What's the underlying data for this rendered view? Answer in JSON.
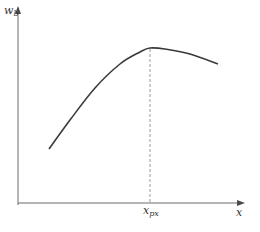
{
  "chart_data": {
    "type": "line",
    "title": "",
    "xlabel": "x",
    "ylabel": "w_b",
    "ylabel_main": "w",
    "ylabel_sub": "b",
    "xtick_label_main": "x",
    "xtick_label_sub": "px",
    "annotations": [
      {
        "type": "vertical-dashed-line",
        "at": "x_px",
        "description": "peak location"
      }
    ],
    "series": [
      {
        "name": "w_b(x)",
        "description": "concave curve rising from lower-left, peaking at x_px, then gently declining",
        "points_px": [
          [
            49,
            149
          ],
          [
            70,
            120
          ],
          [
            95,
            88
          ],
          [
            120,
            64
          ],
          [
            140,
            52
          ],
          [
            150,
            48
          ],
          [
            165,
            49
          ],
          [
            190,
            54
          ],
          [
            218,
            64
          ]
        ]
      }
    ],
    "grid": false,
    "legend": false
  },
  "colors": {
    "axis": "#6b6b6b",
    "curve": "#3a3a3a",
    "dashed": "#9a9a9a"
  }
}
